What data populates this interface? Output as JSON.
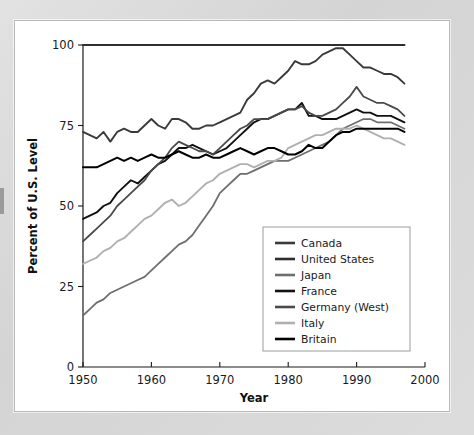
{
  "figure": {
    "alt_title": "Percent of U.S. Level by country, 1950-1997"
  },
  "chart_data": {
    "type": "line",
    "title": "",
    "xlabel": "Year",
    "ylabel": "Percent of U.S. Level",
    "xlim": [
      1950,
      2000
    ],
    "ylim": [
      0,
      100
    ],
    "xticks": [
      1950,
      1960,
      1970,
      1980,
      1990,
      2000
    ],
    "yticks": [
      0,
      25,
      50,
      75,
      100
    ],
    "grid": false,
    "legend_position": "inside-bottom-right",
    "x": [
      1950,
      1951,
      1952,
      1953,
      1954,
      1955,
      1956,
      1957,
      1958,
      1959,
      1960,
      1961,
      1962,
      1963,
      1964,
      1965,
      1966,
      1967,
      1968,
      1969,
      1970,
      1971,
      1972,
      1973,
      1974,
      1975,
      1976,
      1977,
      1978,
      1979,
      1980,
      1981,
      1982,
      1983,
      1984,
      1985,
      1986,
      1987,
      1988,
      1989,
      1990,
      1991,
      1992,
      1993,
      1994,
      1995,
      1996,
      1997
    ],
    "series": [
      {
        "name": "Canada",
        "color": "#3a3a3a",
        "width": 1.9,
        "values": [
          73,
          72,
          71,
          73,
          70,
          73,
          74,
          73,
          73,
          75,
          77,
          75,
          74,
          77,
          77,
          76,
          74,
          74,
          75,
          75,
          76,
          77,
          78,
          79,
          83,
          85,
          88,
          89,
          88,
          90,
          92,
          95,
          94,
          94,
          95,
          97,
          98,
          99,
          99,
          97,
          95,
          93,
          93,
          92,
          91,
          91,
          90,
          88
        ]
      },
      {
        "name": "United States",
        "color": "#2e2e2e",
        "width": 2.1,
        "values": [
          100,
          100,
          100,
          100,
          100,
          100,
          100,
          100,
          100,
          100,
          100,
          100,
          100,
          100,
          100,
          100,
          100,
          100,
          100,
          100,
          100,
          100,
          100,
          100,
          100,
          100,
          100,
          100,
          100,
          100,
          100,
          100,
          100,
          100,
          100,
          100,
          100,
          100,
          100,
          100,
          100,
          100,
          100,
          100,
          100,
          100,
          100,
          100
        ]
      },
      {
        "name": "Japan",
        "color": "#6e6e6e",
        "width": 1.8,
        "values": [
          16,
          18,
          20,
          21,
          23,
          24,
          25,
          26,
          27,
          28,
          30,
          32,
          34,
          36,
          38,
          39,
          41,
          44,
          47,
          50,
          54,
          56,
          58,
          60,
          60,
          61,
          62,
          63,
          64,
          64,
          64,
          65,
          66,
          67,
          68,
          69,
          70,
          72,
          74,
          75,
          76,
          77,
          77,
          76,
          76,
          76,
          75,
          74
        ]
      },
      {
        "name": "France",
        "color": "#111111",
        "width": 1.9,
        "values": [
          46,
          47,
          48,
          50,
          51,
          54,
          56,
          58,
          57,
          59,
          61,
          63,
          64,
          66,
          68,
          68,
          69,
          68,
          67,
          66,
          67,
          68,
          70,
          72,
          74,
          76,
          77,
          77,
          78,
          79,
          80,
          80,
          82,
          78,
          78,
          77,
          77,
          77,
          78,
          79,
          80,
          79,
          79,
          78,
          78,
          78,
          77,
          76
        ]
      },
      {
        "name": "Germany (West)",
        "color": "#4a4a4a",
        "width": 1.8,
        "values": [
          39,
          41,
          43,
          45,
          47,
          50,
          52,
          54,
          56,
          58,
          61,
          63,
          65,
          68,
          70,
          69,
          68,
          67,
          67,
          66,
          68,
          70,
          72,
          74,
          75,
          77,
          77,
          77,
          78,
          79,
          80,
          80,
          81,
          79,
          78,
          78,
          79,
          80,
          82,
          84,
          87,
          84,
          83,
          82,
          82,
          81,
          80,
          78
        ]
      },
      {
        "name": "Italy",
        "color": "#b0b0b0",
        "width": 1.9,
        "values": [
          32,
          33,
          34,
          36,
          37,
          39,
          40,
          42,
          44,
          46,
          47,
          49,
          51,
          52,
          50,
          51,
          53,
          55,
          57,
          58,
          60,
          61,
          62,
          63,
          63,
          62,
          63,
          64,
          64,
          65,
          68,
          69,
          70,
          71,
          72,
          72,
          73,
          74,
          74,
          74,
          75,
          74,
          73,
          72,
          71,
          71,
          70,
          69
        ]
      },
      {
        "name": "Britain",
        "color": "#000000",
        "width": 2.0,
        "values": [
          62,
          62,
          62,
          63,
          64,
          65,
          64,
          65,
          64,
          65,
          66,
          65,
          65,
          66,
          67,
          66,
          65,
          65,
          66,
          65,
          65,
          66,
          67,
          68,
          67,
          66,
          67,
          68,
          68,
          67,
          66,
          66,
          67,
          69,
          68,
          68,
          70,
          72,
          73,
          73,
          74,
          74,
          74,
          74,
          74,
          74,
          74,
          73
        ]
      }
    ]
  },
  "legend": {
    "items": [
      {
        "label": "Canada"
      },
      {
        "label": "United States"
      },
      {
        "label": "Japan"
      },
      {
        "label": "France"
      },
      {
        "label": "Germany (West)"
      },
      {
        "label": "Italy"
      },
      {
        "label": "Britain"
      }
    ]
  }
}
